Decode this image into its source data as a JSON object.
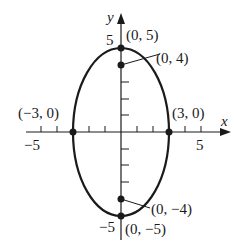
{
  "diagram": {
    "type": "ellipse-graph",
    "equation_hint": "vertical ellipse centered at origin",
    "axes": {
      "x_label": "x",
      "y_label": "y",
      "x_tick_labels": {
        "neg": "-5",
        "pos": "5"
      },
      "y_tick_labels": {
        "pos": "5",
        "neg": "-5"
      },
      "x_range": [
        -6,
        7
      ],
      "y_range": [
        -6,
        6
      ],
      "x_ticks": [
        -5,
        -4,
        -3,
        -2,
        -1,
        1,
        2,
        3,
        4,
        5
      ],
      "y_ticks": [
        -4,
        -3,
        -2,
        -1,
        1,
        2,
        3,
        4
      ]
    },
    "ellipse": {
      "center": [
        0,
        0
      ],
      "semi_major": 5,
      "semi_minor": 3,
      "orientation": "vertical"
    },
    "points": [
      {
        "name": "vertex-top",
        "coords": [
          0,
          5
        ],
        "label": "(0, 5)"
      },
      {
        "name": "focus-top",
        "coords": [
          0,
          4
        ],
        "label": "(0, 4)"
      },
      {
        "name": "co-vertex-left",
        "coords": [
          -3,
          0
        ],
        "label": "(−3, 0)"
      },
      {
        "name": "co-vertex-right",
        "coords": [
          3,
          0
        ],
        "label": "(3, 0)"
      },
      {
        "name": "focus-bottom",
        "coords": [
          0,
          -4
        ],
        "label": "(0, −4)"
      },
      {
        "name": "vertex-bottom",
        "coords": [
          0,
          -5
        ],
        "label": "(0, −5)"
      }
    ],
    "labels": {
      "top_vertex": "(0, 5)",
      "top_focus": "(0, 4)",
      "left_covertex": "(−3, 0)",
      "right_covertex": "(3, 0)",
      "bottom_focus": "(0, −4)",
      "bottom_vertex": "(0, −5)",
      "x_neg5": "−5",
      "x_pos5": "5",
      "y_pos5": "5",
      "y_neg5": "−5",
      "x_axis": "x",
      "y_axis": "y"
    },
    "colors": {
      "stroke": "#1a1a1a",
      "background": "#ffffff"
    }
  }
}
